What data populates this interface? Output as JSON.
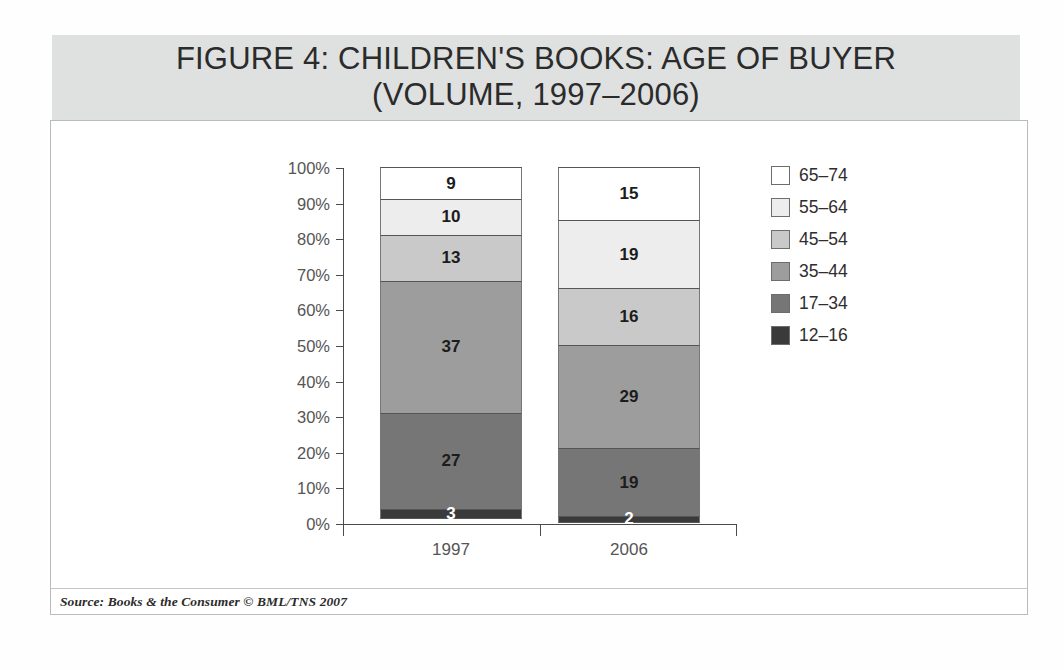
{
  "figure": {
    "title": "FIGURE 4: CHILDREN'S BOOKS: AGE OF BUYER\n(VOLUME, 1997–2006)",
    "source": "Source: Books & the Consumer © BML/TNS 2007"
  },
  "chart_data": {
    "type": "bar",
    "subtype": "stacked-100-percent",
    "title": "FIGURE 4: CHILDREN'S BOOKS: AGE OF BUYER (VOLUME, 1997–2006)",
    "xlabel": "",
    "ylabel": "",
    "ylim": [
      0,
      100
    ],
    "grid": false,
    "legend_position": "right",
    "categories": [
      "1997",
      "2006"
    ],
    "y_ticks": [
      "0%",
      "10%",
      "20%",
      "30%",
      "40%",
      "50%",
      "60%",
      "70%",
      "80%",
      "90%",
      "100%"
    ],
    "series": [
      {
        "name": "12–16",
        "color": "#3a3a3a",
        "values": [
          3,
          2
        ]
      },
      {
        "name": "17–34",
        "color": "#767676",
        "values": [
          27,
          19
        ]
      },
      {
        "name": "35–44",
        "color": "#9d9d9d",
        "values": [
          37,
          29
        ]
      },
      {
        "name": "45–54",
        "color": "#c9c9c9",
        "values": [
          13,
          16
        ]
      },
      {
        "name": "55–64",
        "color": "#ededed",
        "values": [
          10,
          19
        ]
      },
      {
        "name": "65–74",
        "color": "#ffffff",
        "values": [
          9,
          15
        ]
      }
    ],
    "stack_order_top_to_bottom": [
      "65–74",
      "55–64",
      "45–54",
      "35–44",
      "17–34",
      "12–16"
    ],
    "data_labels": {
      "1997": {
        "65–74": "9",
        "55–64": "10",
        "45–54": "13",
        "35–44": "37",
        "17–34": "27",
        "12–16": "3"
      },
      "2006": {
        "65–74": "15",
        "55–64": "19",
        "45–54": "16",
        "35–44": "29",
        "17–34": "19",
        "12–16": "2"
      }
    }
  },
  "legend": {
    "items": [
      {
        "label": "65–74",
        "color": "#ffffff"
      },
      {
        "label": "55–64",
        "color": "#ededed"
      },
      {
        "label": "45–54",
        "color": "#c9c9c9"
      },
      {
        "label": "35–44",
        "color": "#9d9d9d"
      },
      {
        "label": "17–34",
        "color": "#767676"
      },
      {
        "label": "12–16",
        "color": "#3a3a3a"
      }
    ]
  }
}
